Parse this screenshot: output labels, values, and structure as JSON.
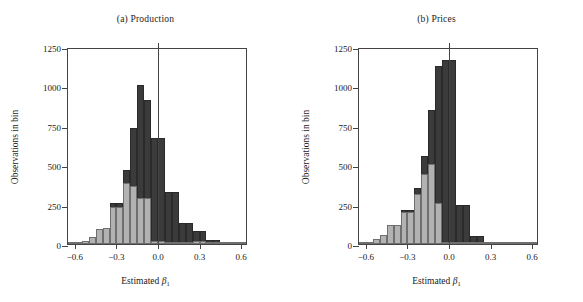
{
  "figure": {
    "width": 583,
    "height": 302,
    "background": "#ffffff",
    "colors": {
      "dark_series": "#3b3b3b",
      "light_series": "#b2b2b2",
      "axis": "#444444",
      "text": "#1a1a1a"
    }
  },
  "chart_data": [
    {
      "type": "bar",
      "subtype": "histogram-overlay",
      "panel": "a",
      "title": "(a) Production",
      "xlabel": "Estimated β₁",
      "ylabel": "Observations in bin",
      "xlim": [
        -0.65,
        0.65
      ],
      "ylim": [
        0,
        1250
      ],
      "bin_width": 0.05,
      "grid": false,
      "legend": "none",
      "xticks": [
        -0.6,
        -0.3,
        0.0,
        0.3,
        0.6
      ],
      "xticklabels": [
        "−0.6",
        "−0.3",
        "0.0",
        "0.3",
        "0.6"
      ],
      "yticks": [
        0,
        250,
        500,
        750,
        1000,
        1250
      ],
      "yticklabels": [
        "0",
        "250",
        "500",
        "750",
        "1000",
        "1250"
      ],
      "annotations": [
        {
          "type": "vline",
          "x": 0.0,
          "color": "#444444"
        }
      ],
      "bin_left_edges": [
        -0.65,
        -0.6,
        -0.55,
        -0.5,
        -0.45,
        -0.4,
        -0.35,
        -0.3,
        -0.25,
        -0.2,
        -0.15,
        -0.1,
        -0.05,
        0.0,
        0.05,
        0.1,
        0.15,
        0.2,
        0.25,
        0.3,
        0.35,
        0.4,
        0.45,
        0.5,
        0.55,
        0.6
      ],
      "series": [
        {
          "name": "dark",
          "color": "#3b3b3b",
          "values": [
            4,
            8,
            20,
            42,
            98,
            100,
            262,
            262,
            472,
            738,
            1010,
            912,
            672,
            672,
            332,
            332,
            135,
            135,
            80,
            80,
            24,
            24,
            10,
            6,
            4,
            3
          ]
        },
        {
          "name": "light",
          "color": "#b2b2b2",
          "values": [
            4,
            8,
            20,
            42,
            98,
            100,
            232,
            232,
            385,
            368,
            290,
            290,
            18,
            18,
            10,
            10,
            8,
            8,
            22,
            22,
            6,
            4,
            3,
            2,
            2,
            2
          ]
        }
      ]
    },
    {
      "type": "bar",
      "subtype": "histogram-overlay",
      "panel": "b",
      "title": "(b) Prices",
      "xlabel": "Estimated β₁",
      "ylabel": "Observations in bin",
      "xlim": [
        -0.65,
        0.65
      ],
      "ylim": [
        0,
        1250
      ],
      "bin_width": 0.05,
      "grid": false,
      "legend": "none",
      "xticks": [
        -0.6,
        -0.3,
        0.0,
        0.3,
        0.6
      ],
      "xticklabels": [
        "−0.6",
        "−0.3",
        "0.0",
        "0.3",
        "0.6"
      ],
      "yticks": [
        0,
        250,
        500,
        750,
        1000,
        1250
      ],
      "yticklabels": [
        "0",
        "250",
        "500",
        "750",
        "1000",
        "1250"
      ],
      "annotations": [
        {
          "type": "vline",
          "x": 0.0,
          "color": "#444444"
        }
      ],
      "bin_left_edges": [
        -0.65,
        -0.6,
        -0.55,
        -0.5,
        -0.45,
        -0.4,
        -0.35,
        -0.3,
        -0.25,
        -0.2,
        -0.15,
        -0.1,
        -0.05,
        0.0,
        0.05,
        0.1,
        0.15,
        0.2,
        0.25,
        0.3,
        0.35,
        0.4,
        0.45,
        0.5,
        0.55,
        0.6
      ],
      "series": [
        {
          "name": "dark",
          "color": "#3b3b3b",
          "values": [
            5,
            12,
            30,
            55,
            120,
            120,
            215,
            215,
            355,
            560,
            850,
            1130,
            1170,
            1170,
            248,
            248,
            48,
            48,
            12,
            12,
            5,
            3,
            2,
            2,
            2,
            2
          ]
        },
        {
          "name": "light",
          "color": "#b2b2b2",
          "values": [
            5,
            12,
            30,
            55,
            120,
            120,
            205,
            205,
            318,
            445,
            505,
            262,
            4,
            4,
            3,
            3,
            2,
            2,
            2,
            2,
            1,
            1,
            1,
            1,
            1,
            1
          ]
        }
      ]
    }
  ]
}
